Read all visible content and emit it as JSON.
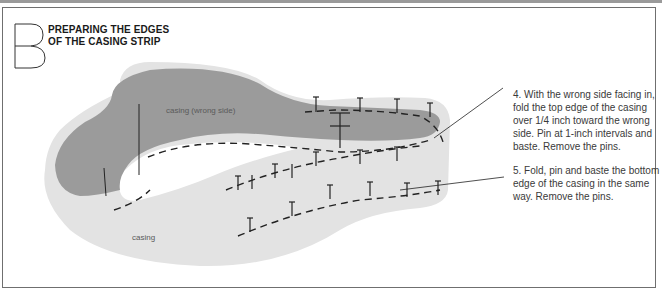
{
  "header": {
    "step_letter": "B",
    "title_line1": "PREPARING THE EDGES",
    "title_line2": "OF THE CASING STRIP"
  },
  "illustration": {
    "labels": {
      "casing_wrong_side": "casing (wrong side)",
      "casing": "casing"
    },
    "colors": {
      "wrong_side_fill": "#9b9b9b",
      "casing_fill": "#e3e3e3",
      "stitch": "#222222",
      "frame": "#6f6f6f"
    }
  },
  "instructions": [
    {
      "step": 4,
      "text": "4. With the wrong side facing in, fold the top edge of the casing over 1/4 inch toward the wrong side. Pin at 1-inch intervals and baste. Remove the pins."
    },
    {
      "step": 5,
      "text": "5. Fold, pin and baste the bottom edge of the casing in the same way. Remove the pins."
    }
  ]
}
